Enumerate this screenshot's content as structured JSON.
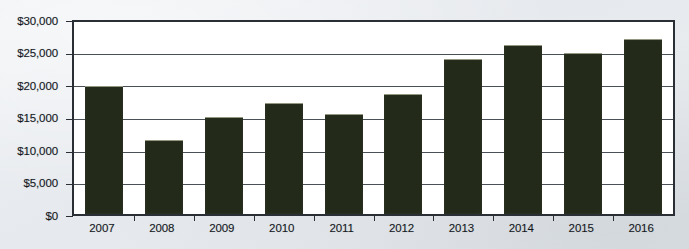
{
  "chart_data": {
    "type": "bar",
    "title": "",
    "subtitle": "",
    "xlabel": "",
    "ylabel": "",
    "categories": [
      "2007",
      "2008",
      "2009",
      "2010",
      "2011",
      "2012",
      "2013",
      "2014",
      "2015",
      "2016"
    ],
    "values": [
      20000,
      11600,
      15200,
      17300,
      15700,
      18800,
      24200,
      26400,
      25100,
      27400
    ],
    "series": [
      {
        "name": "",
        "values": [
          20000,
          11600,
          15200,
          17300,
          15700,
          18800,
          24200,
          26400,
          25100,
          27400
        ]
      }
    ],
    "ylim": [
      0,
      30000
    ],
    "ytick_values": [
      0,
      5000,
      10000,
      15000,
      20000,
      25000,
      30000
    ],
    "ytick_labels": [
      "$0",
      "$5,000",
      "$10,000",
      "$15,000",
      "$20,000",
      "$25,000",
      "$30,000"
    ],
    "grid": true,
    "grid_axis": "y",
    "legend": false,
    "legend_position": "none",
    "bar_color": "#232a1a",
    "plot_background": "#ffffff",
    "page_background": "#e9ecef",
    "axis_color": "#2a2f35",
    "gridline_color": "#4a5057",
    "annotations": []
  }
}
